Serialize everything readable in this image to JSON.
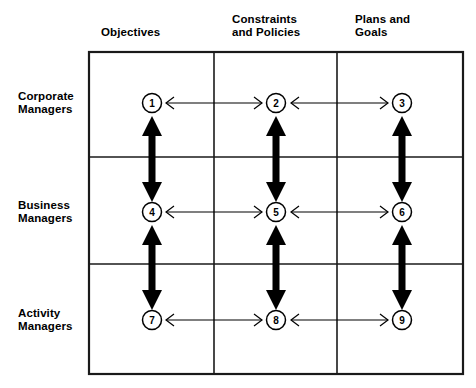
{
  "diagram": {
    "type": "matrix-grid",
    "background_color": "#ffffff",
    "line_color": "#000000",
    "columns": [
      {
        "id": "objectives",
        "label": "Objectives",
        "lines": [
          "Objectives"
        ]
      },
      {
        "id": "constraints-and-policies",
        "label": "Constraints and Policies",
        "lines": [
          "Constraints",
          "and Policies"
        ]
      },
      {
        "id": "plans-and-goals",
        "label": "Plans and Goals",
        "lines": [
          "Plans and",
          "Goals"
        ]
      }
    ],
    "rows": [
      {
        "id": "corporate-managers",
        "label": "Corporate Managers",
        "lines": [
          "Corporate",
          "Managers"
        ]
      },
      {
        "id": "business-managers",
        "label": "Business Managers",
        "lines": [
          "Business",
          "Managers"
        ]
      },
      {
        "id": "activity-managers",
        "label": "Activity Managers",
        "lines": [
          "Activity",
          "Managers"
        ]
      }
    ],
    "nodes": [
      {
        "number": "1",
        "row": "corporate-managers",
        "column": "objectives"
      },
      {
        "number": "2",
        "row": "corporate-managers",
        "column": "constraints-and-policies"
      },
      {
        "number": "3",
        "row": "corporate-managers",
        "column": "plans-and-goals"
      },
      {
        "number": "4",
        "row": "business-managers",
        "column": "objectives"
      },
      {
        "number": "5",
        "row": "business-managers",
        "column": "constraints-and-policies"
      },
      {
        "number": "6",
        "row": "business-managers",
        "column": "plans-and-goals"
      },
      {
        "number": "7",
        "row": "activity-managers",
        "column": "objectives"
      },
      {
        "number": "8",
        "row": "activity-managers",
        "column": "constraints-and-policies"
      },
      {
        "number": "9",
        "row": "activity-managers",
        "column": "plans-and-goals"
      }
    ],
    "horizontal_connections": [
      {
        "from": "1",
        "to": "2",
        "style": "thin",
        "direction": "bidirectional"
      },
      {
        "from": "2",
        "to": "3",
        "style": "thin",
        "direction": "bidirectional"
      },
      {
        "from": "4",
        "to": "5",
        "style": "thin",
        "direction": "bidirectional"
      },
      {
        "from": "5",
        "to": "6",
        "style": "thin",
        "direction": "bidirectional"
      },
      {
        "from": "7",
        "to": "8",
        "style": "thin",
        "direction": "bidirectional"
      },
      {
        "from": "8",
        "to": "9",
        "style": "thin",
        "direction": "bidirectional"
      }
    ],
    "vertical_connections": [
      {
        "from": "1",
        "to": "4",
        "style": "thick",
        "direction": "bidirectional"
      },
      {
        "from": "2",
        "to": "5",
        "style": "thick",
        "direction": "bidirectional"
      },
      {
        "from": "3",
        "to": "6",
        "style": "thick",
        "direction": "bidirectional"
      },
      {
        "from": "4",
        "to": "7",
        "style": "thick",
        "direction": "bidirectional"
      },
      {
        "from": "5",
        "to": "8",
        "style": "thick",
        "direction": "bidirectional"
      },
      {
        "from": "6",
        "to": "9",
        "style": "thick",
        "direction": "bidirectional"
      }
    ]
  }
}
